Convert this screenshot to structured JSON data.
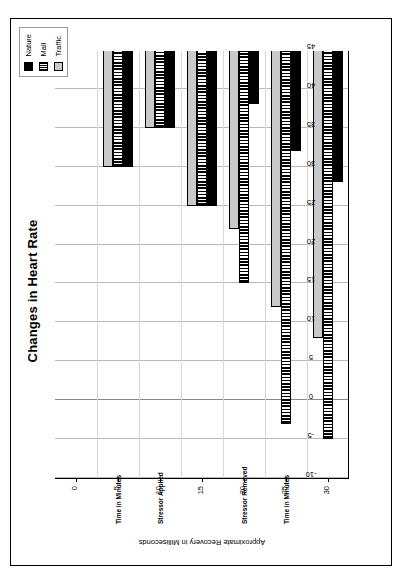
{
  "chart_data": {
    "type": "bar",
    "orientation": "horizontal",
    "title": "Changes in Heart Rate",
    "xlabel": "Approximate Recovery in Milliseconds",
    "ylabel": "",
    "xlim": [
      -10,
      45
    ],
    "xticks": [
      "-10",
      "-5",
      "0",
      "5",
      "10",
      "15",
      "20",
      "25",
      "30",
      "35",
      "40",
      "45"
    ],
    "grid": true,
    "legend_position": "top-right",
    "categories": [
      "0",
      "5",
      "10",
      "15",
      "20",
      "25",
      "30"
    ],
    "category_notes": [
      {
        "category": "5",
        "note": "Time in Minutes"
      },
      {
        "category": "10",
        "note": "Stressor Applied"
      },
      {
        "category": "20",
        "note": "Stressor Removed"
      },
      {
        "category": "25",
        "note": "Time in Minutes"
      }
    ],
    "series": [
      {
        "name": "Nature",
        "color": "#000000",
        "pattern": "solid-black",
        "values": [
          45,
          30,
          35,
          25,
          38,
          32,
          28
        ]
      },
      {
        "name": "Mall",
        "color": "#000000",
        "pattern": "vertical-stripes",
        "values": [
          45,
          30,
          35,
          25,
          15,
          -3,
          -5
        ]
      },
      {
        "name": "Traffic",
        "color": "#c9c9c9",
        "pattern": "solid-light-gray",
        "values": [
          45,
          30,
          35,
          25,
          22,
          12,
          8
        ]
      }
    ]
  },
  "legend": {
    "items": [
      {
        "label": "Nature",
        "swatch": "nature-swatch-icon"
      },
      {
        "label": "Mall",
        "swatch": "mall-swatch-icon"
      },
      {
        "label": "Traffic",
        "swatch": "traffic-swatch-icon"
      }
    ]
  }
}
